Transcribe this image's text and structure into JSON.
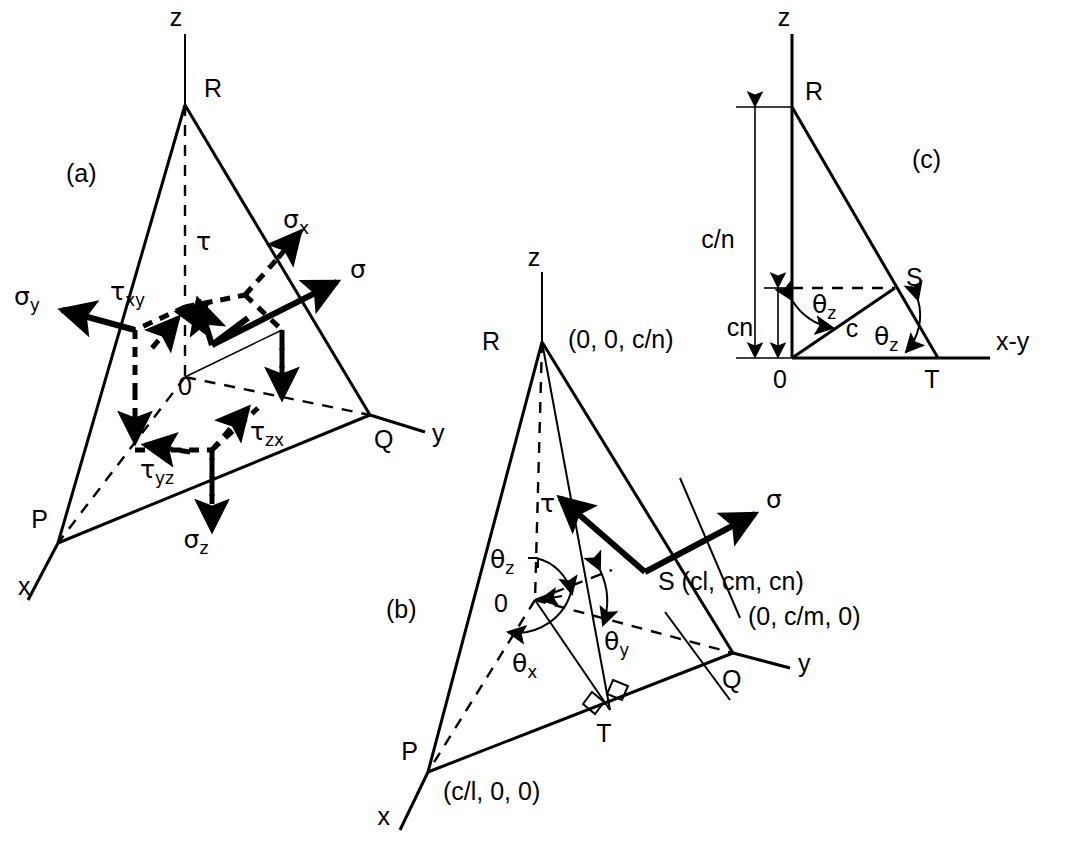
{
  "figure": {
    "background_color": "#ffffff",
    "line_color": "#000000",
    "panels": [
      {
        "id": "a",
        "tag": "(a)"
      },
      {
        "id": "b",
        "tag": "(b)"
      },
      {
        "id": "c",
        "tag": "(c)"
      }
    ]
  },
  "panel_a": {
    "tag": "(a)",
    "axes": {
      "z": "z",
      "x": "x",
      "y": "y"
    },
    "vertices": {
      "R": "R",
      "P": "P",
      "Q": "Q",
      "origin": "0"
    },
    "stresses": {
      "sigma": "σ",
      "sigma_x": "σ",
      "sigma_x_sub": "x",
      "sigma_y": "σ",
      "sigma_y_sub": "y",
      "sigma_z": "σ",
      "sigma_z_sub": "z",
      "tau": "τ",
      "tau_xy": "τ",
      "tau_xy_sub": "xy",
      "tau_yz": "τ",
      "tau_yz_sub": "yz",
      "tau_zx": "τ",
      "tau_zx_sub": "zx"
    }
  },
  "panel_b": {
    "tag": "(b)",
    "axes": {
      "z": "z",
      "x": "x",
      "y": "y"
    },
    "vertices": {
      "R": "R",
      "P": "P",
      "Q": "Q",
      "S": "S",
      "T": "T",
      "origin": "0"
    },
    "coordinates": {
      "R": "(0, 0, c/n)",
      "P": "(c/l, 0, 0)",
      "Q": "(0, c/m, 0)",
      "S": "S (cl, cm, cn)"
    },
    "angles": {
      "theta_x": "θ",
      "theta_x_sub": "x",
      "theta_y": "θ",
      "theta_y_sub": "y",
      "theta_z": "θ",
      "theta_z_sub": "z"
    },
    "stresses": {
      "sigma": "σ",
      "tau": "τ"
    }
  },
  "panel_c": {
    "tag": "(c)",
    "axes": {
      "z": "z",
      "xy": "x-y"
    },
    "vertices": {
      "R": "R",
      "S": "S",
      "T": "T",
      "origin": "0"
    },
    "dimensions": {
      "c_over_n": "c/n",
      "cn": "cn",
      "c": "c"
    },
    "angles": {
      "theta_z_top": "θ",
      "theta_z_top_sub": "z",
      "theta_z_bottom": "θ",
      "theta_z_bottom_sub": "z"
    }
  }
}
